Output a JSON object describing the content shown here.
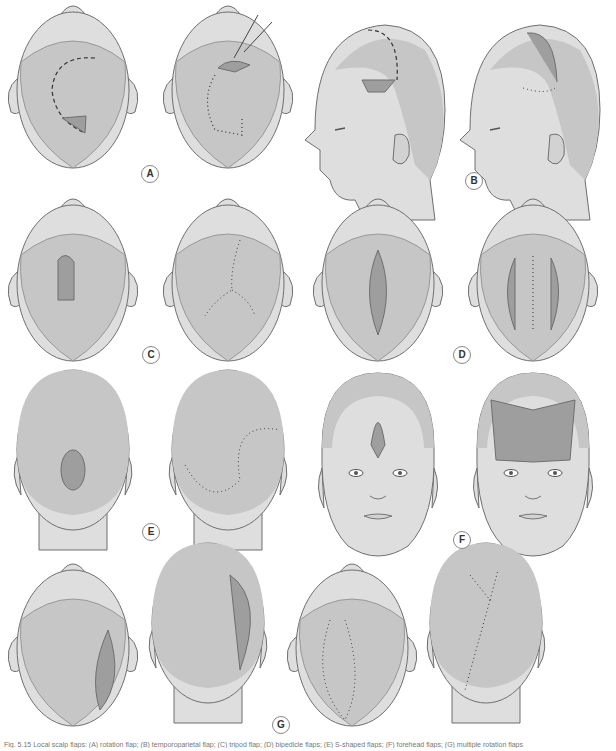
{
  "figure": {
    "panels": [
      {
        "id": "A",
        "label": "A",
        "views": [
          "top-view rotation flap design",
          "top-view rotation flap sutured with skin hook"
        ]
      },
      {
        "id": "B",
        "label": "B",
        "views": [
          "lateral-view temporoparietal flap design",
          "lateral-view flap transposed and sutured"
        ]
      },
      {
        "id": "C",
        "label": "C",
        "views": [
          "top-view tripod (pinwheel) flap design",
          "top-view Y-shaped suture closure"
        ]
      },
      {
        "id": "D",
        "label": "D",
        "views": [
          "top-view bipedicle relaxing incisions",
          "top-view central closure with lateral defects"
        ]
      },
      {
        "id": "E",
        "label": "E",
        "views": [
          "posterior-view S-shaped double rotation flap design",
          "posterior-view S-shaped closure"
        ]
      },
      {
        "id": "F",
        "label": "F",
        "views": [
          "frontal-view forehead defect with incision",
          "frontal-view advanced bilateral flaps"
        ]
      },
      {
        "id": "G",
        "label": "G",
        "views": [
          "top-view large rotation flap",
          "posterior-view rotation flap",
          "top-view multiple flaps sutured",
          "posterior-view multiple flaps sutured"
        ]
      }
    ],
    "colors": {
      "hair": "#c6c6c6",
      "skin": "#dedede",
      "flap": "#9e9e9e",
      "outline": "#6f6f6f",
      "suture": "#333333"
    },
    "caption": "Fig. 5.15 Local scalp flaps: (A) rotation flap; (B) temporoparietal flap; (C) tripod flap; (D) bipedicle flaps; (E) S-shaped flaps; (F) forehead flaps; (G) multiple rotation flaps"
  }
}
